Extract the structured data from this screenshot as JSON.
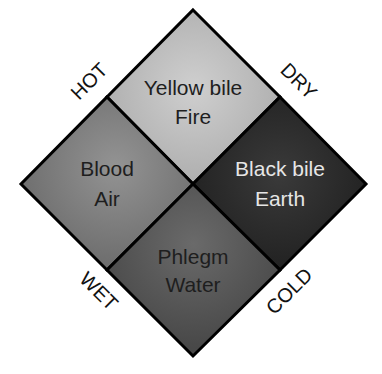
{
  "diagram": {
    "quadrants": [
      {
        "id": "top",
        "line1": "Yellow bile",
        "line2": "Fire",
        "fill": "#b9b9b9",
        "text_color": "#1e1e1e"
      },
      {
        "id": "left",
        "line1": "Blood",
        "line2": "Air",
        "fill": "#7e7e7e",
        "text_color": "#1e1e1e"
      },
      {
        "id": "right",
        "line1": "Black bile",
        "line2": "Earth",
        "fill": "#2a2a2a",
        "text_color": "#e6e6e6"
      },
      {
        "id": "bottom",
        "line1": "Phlegm",
        "line2": "Water",
        "fill": "#575757",
        "text_color": "#1e1e1e"
      }
    ],
    "axis_labels": {
      "top_left": "HOT",
      "top_right": "DRY",
      "bottom_left": "WET",
      "bottom_right": "COLD"
    }
  }
}
